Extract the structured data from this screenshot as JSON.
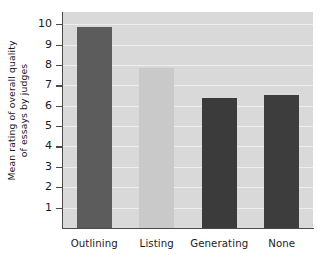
{
  "chart_data": {
    "type": "bar",
    "title": "",
    "xlabel": "",
    "ylabel_line1": "Mean rating of overall quality",
    "ylabel_line2": "of essays by judges",
    "categories": [
      "Outlining",
      "Listing",
      "Generating",
      "None"
    ],
    "values": [
      9.85,
      7.85,
      6.4,
      6.55
    ],
    "bar_colors": [
      "#5c5c5c",
      "#c9c9c9",
      "#3b3b3b",
      "#3d3d3d"
    ],
    "ylim": [
      0,
      10.6
    ],
    "yticks": [
      1,
      2,
      3,
      4,
      5,
      6,
      7,
      8,
      9,
      10
    ],
    "ytick_labels": [
      "1",
      "2",
      "3",
      "4",
      "5",
      "6",
      "7",
      "8",
      "9",
      "10"
    ],
    "grid": true,
    "grid_color": "#f0f0f0",
    "legend": "none",
    "plot_background": "#d9d9d9",
    "axis_color": "#4a4a4a",
    "figure_background": "#ffffff"
  }
}
